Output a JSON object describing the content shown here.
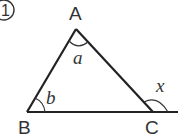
{
  "problem_number": "1",
  "vertices": {
    "A": {
      "label": "A"
    },
    "B": {
      "label": "B"
    },
    "C": {
      "label": "C"
    }
  },
  "angles": {
    "at_A": {
      "label": "a"
    },
    "at_B": {
      "label": "b"
    },
    "exterior_at_C": {
      "label": "x"
    }
  },
  "colors": {
    "stroke": "#222222",
    "text": "#333333",
    "background": "#ffffff"
  }
}
